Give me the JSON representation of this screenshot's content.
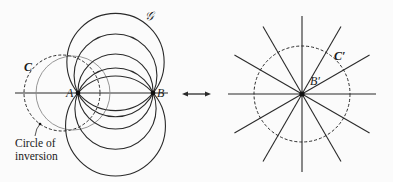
{
  "left_figure": {
    "point_a_label": "A",
    "point_b_label": "B",
    "family_label": "𝒢",
    "circle_c_label": "C",
    "caption_line1": "Circle of",
    "caption_line2": "inversion",
    "family_center_offsets": [
      31,
      17.6,
      1.5,
      -15.6,
      -33
    ]
  },
  "arrow": {
    "symbol": "double-headed-arrow"
  },
  "right_figure": {
    "point_label": "B′",
    "circle_label": "C′",
    "line_angles_deg": [
      0,
      30,
      60,
      90,
      120,
      150
    ]
  },
  "colors": {
    "ink": "#2a2a2a",
    "gray_circle": "#8a8a8a",
    "background": "#fbfbfb"
  }
}
